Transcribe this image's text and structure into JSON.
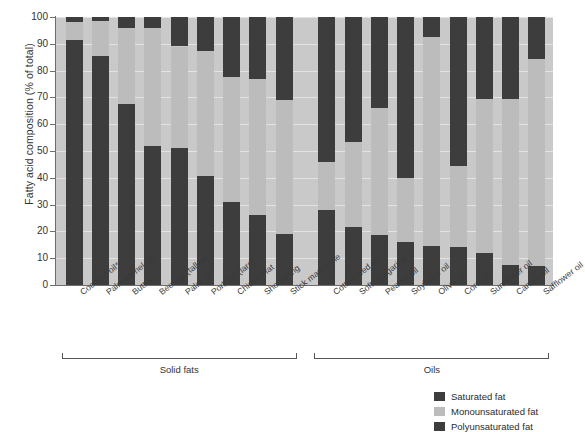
{
  "chart_data": {
    "type": "bar",
    "subtype": "stacked-bar-100",
    "title": "",
    "xlabel": "",
    "ylabel": "Fatty acid composition (% of total)",
    "ylim": [
      0,
      100
    ],
    "yticks": [
      0,
      10,
      20,
      30,
      40,
      50,
      60,
      70,
      80,
      90,
      100
    ],
    "grid": true,
    "legend_position": "bottom-right",
    "categories": [
      "Coconut oil*",
      "Palm kernel oil*",
      "Butter",
      "Beef fat (tallow)",
      "Palm oil*",
      "Pork fat (lard)",
      "Chicken fat",
      "Shortening",
      "Stick margarine",
      "Cottonseed oil",
      "Soft margarine",
      "Peanut oil",
      "Soybean oil",
      "Olive oil",
      "Corn oil",
      "Sunflower oil",
      "Canola oil",
      "Safflower oil"
    ],
    "series": [
      {
        "name": "Saturated fat",
        "color": "#3d3d3d",
        "values": [
          91.5,
          85.5,
          67.5,
          52,
          51,
          40.5,
          31,
          26,
          19,
          28,
          21.5,
          18.5,
          16,
          14.5,
          14,
          12,
          7.5,
          7
        ]
      },
      {
        "name": "Monounsaturated fat",
        "color": "#bcbcbc",
        "values": [
          6.5,
          13,
          28.5,
          44,
          38,
          47,
          46.5,
          51,
          50,
          18,
          32,
          47.5,
          24,
          78,
          30.5,
          57.5,
          62,
          77.5
        ]
      },
      {
        "name": "Polyunsaturated fat",
        "color": "#3d3d3d",
        "values": [
          2,
          1.5,
          4,
          4,
          11,
          12.5,
          22.5,
          23,
          31,
          54,
          46.5,
          34,
          60,
          7.5,
          55.5,
          30.5,
          30.5,
          15.5
        ]
      }
    ],
    "groups": [
      {
        "label": "Solid fats",
        "start_index": 0,
        "end_index": 8
      },
      {
        "label": "Oils",
        "start_index": 9,
        "end_index": 17
      }
    ],
    "legend": [
      {
        "label": "Saturated fat",
        "color": "#3d3d3d"
      },
      {
        "label": "Monounsaturated fat",
        "color": "#bcbcbc"
      },
      {
        "label": "Polyunsaturated fat",
        "color": "#3d3d3d"
      }
    ],
    "footnote_marker": "*",
    "plot_background": "#c9c9c9"
  }
}
